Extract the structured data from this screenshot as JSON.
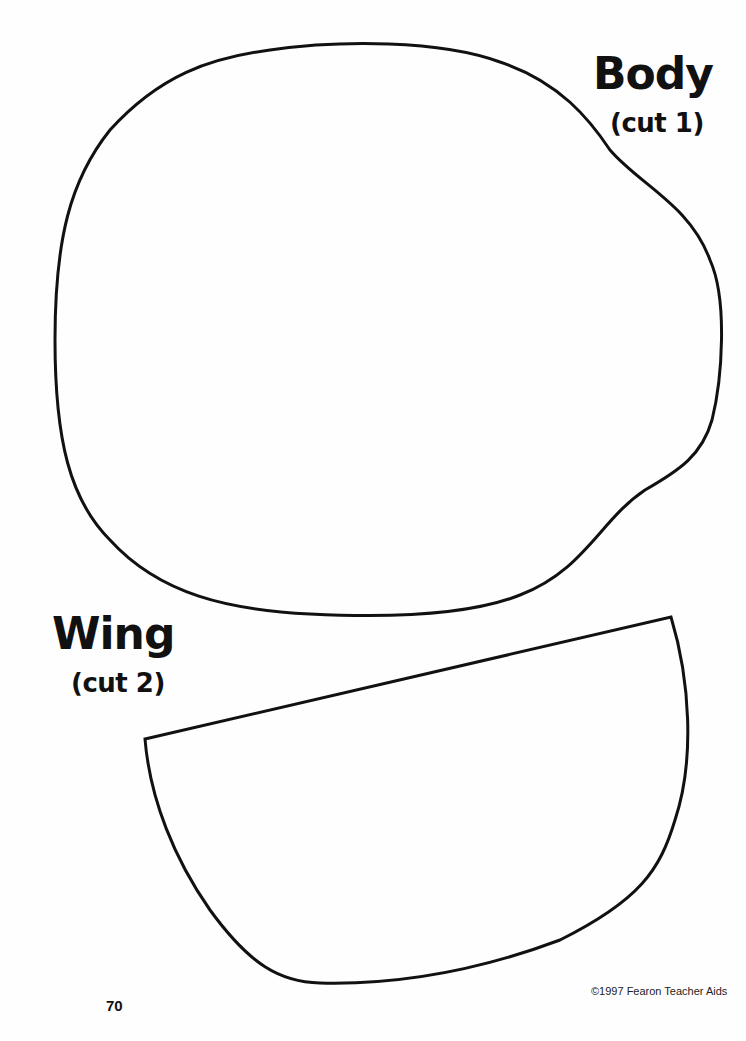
{
  "pieces": [
    {
      "name": "Body",
      "instruction": "(cut 1)"
    },
    {
      "name": "Wing",
      "instruction": "(cut 2)"
    }
  ],
  "footer": {
    "page_number": "70",
    "copyright": "©1997 Fearon Teacher Aids"
  },
  "colors": {
    "outline": "#111111",
    "background": "#fefefe"
  }
}
